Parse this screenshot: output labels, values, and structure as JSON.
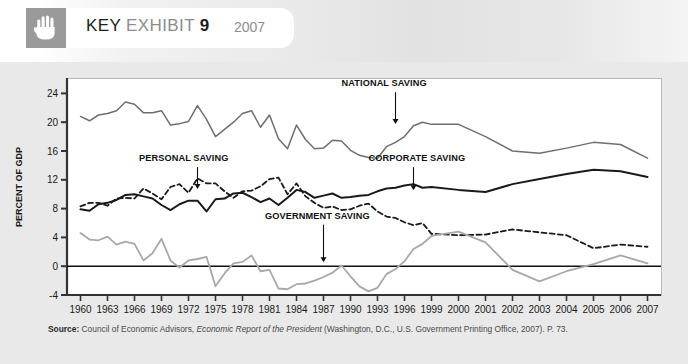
{
  "header": {
    "icon": "hand-icon",
    "title_key": "KEY",
    "title_exhibit": "EXHIBIT",
    "title_number": "9",
    "year": "2007"
  },
  "source": {
    "label": "Source:",
    "text_before_italic": " Council of Economic Advisors, ",
    "italic": "Economic Report of the President",
    "text_after_italic": " (Washington, D.C., U.S. Government Printing Office, 2007). P. 73."
  },
  "colors": {
    "national": "#6e6e6e",
    "personal": "#1a1a1a",
    "corporate": "#1a1a1a",
    "government": "#a8a8a8",
    "axis": "#333333",
    "frame": "#b9b9b9",
    "plot_background": "#ffffff",
    "figure_background": "#e9e9e9",
    "hand_tile": "#9a9a9a"
  },
  "chart_data": {
    "type": "line",
    "title": "KEY EXHIBIT 9",
    "xlabel": "",
    "ylabel": "PERCENT OF GDP",
    "ylim": [
      -4,
      26
    ],
    "yticks": [
      -4,
      0,
      4,
      8,
      12,
      16,
      20,
      24
    ],
    "xlim": [
      1960,
      2007
    ],
    "xtick_labels": [
      "1960",
      "1963",
      "1966",
      "1969",
      "1972",
      "1975",
      "1978",
      "1981",
      "1984",
      "1987",
      "1990",
      "1993",
      "1996",
      "1999",
      "2000",
      "2001",
      "2002",
      "2003",
      "2004",
      "2005",
      "2006",
      "2007"
    ],
    "xtick_values": [
      1960,
      1963,
      1966,
      1969,
      1972,
      1975,
      1978,
      1981,
      1984,
      1987,
      1990,
      1993,
      1996,
      1999,
      2000,
      2001,
      2002,
      2003,
      2004,
      2005,
      2006,
      2007
    ],
    "grid": false,
    "legend_position": "inline-annotations",
    "zero_line": 0,
    "annotations": [
      {
        "label": "NATIONAL SAVING",
        "series": "national",
        "year": 1995,
        "text_x": 1989.0,
        "text_y": 25.0,
        "arrow_to_y": 19.6
      },
      {
        "label": "PERSONAL SAVING",
        "series": "personal",
        "year": 1973,
        "text_x": 1966.5,
        "text_y": 14.6,
        "arrow_to_y": 10.6
      },
      {
        "label": "CORPORATE SAVING",
        "series": "corporate",
        "year": 1997,
        "text_x": 1992.0,
        "text_y": 14.6,
        "arrow_to_y": 10.4
      },
      {
        "label": "GOVERNMENT SAVING",
        "series": "government",
        "year": 1987,
        "text_x": 1980.5,
        "text_y": 6.6,
        "arrow_to_y": 0.4
      }
    ],
    "series": [
      {
        "name": "NATIONAL SAVING",
        "key": "national",
        "color": "#6e6e6e",
        "style": "solid",
        "width": 1.5,
        "x": [
          1960,
          1961,
          1962,
          1963,
          1964,
          1965,
          1966,
          1967,
          1968,
          1969,
          1970,
          1971,
          1972,
          1973,
          1974,
          1975,
          1976,
          1977,
          1978,
          1979,
          1980,
          1981,
          1982,
          1983,
          1984,
          1985,
          1986,
          1987,
          1988,
          1989,
          1990,
          1991,
          1992,
          1993,
          1994,
          1995,
          1996,
          1997,
          1998,
          1999,
          2000,
          2001,
          2002,
          2003,
          2004,
          2005,
          2006,
          2007
        ],
        "values": [
          20.8,
          20.2,
          21.0,
          21.2,
          21.6,
          22.8,
          22.5,
          21.3,
          21.3,
          21.6,
          19.6,
          19.8,
          20.1,
          22.3,
          20.4,
          18.0,
          19.0,
          20.0,
          21.2,
          21.6,
          19.3,
          21.0,
          17.7,
          16.3,
          19.6,
          17.6,
          16.3,
          16.4,
          17.5,
          17.4,
          16.1,
          15.4,
          15.1,
          15.0,
          16.6,
          17.2,
          18.0,
          19.5,
          20.0,
          19.7,
          19.7,
          18.0,
          16.0,
          15.7,
          16.4,
          17.2,
          16.9,
          15.0
        ]
      },
      {
        "name": "PERSONAL SAVING",
        "key": "personal",
        "color": "#1a1a1a",
        "style": "dashed",
        "width": 1.8,
        "x": [
          1960,
          1961,
          1962,
          1963,
          1964,
          1965,
          1966,
          1967,
          1968,
          1969,
          1970,
          1971,
          1972,
          1973,
          1974,
          1975,
          1976,
          1977,
          1978,
          1979,
          1980,
          1981,
          1982,
          1983,
          1984,
          1985,
          1986,
          1987,
          1988,
          1989,
          1990,
          1991,
          1992,
          1993,
          1994,
          1995,
          1996,
          1997,
          1998,
          1999,
          2000,
          2001,
          2002,
          2003,
          2004,
          2005,
          2006,
          2007
        ],
        "values": [
          8.3,
          8.8,
          8.8,
          8.4,
          9.4,
          9.5,
          9.4,
          10.8,
          10.1,
          9.3,
          11.0,
          11.4,
          10.2,
          12.2,
          11.5,
          11.5,
          10.4,
          9.5,
          10.4,
          10.5,
          11.1,
          12.1,
          12.3,
          10.0,
          11.5,
          9.7,
          8.8,
          8.1,
          8.3,
          7.8,
          7.9,
          8.4,
          8.7,
          7.6,
          6.9,
          6.7,
          6.1,
          5.7,
          6.0,
          4.5,
          4.3,
          4.4,
          5.1,
          4.7,
          4.3,
          2.5,
          3.0,
          2.7
        ]
      },
      {
        "name": "CORPORATE SAVING",
        "key": "corporate",
        "color": "#1a1a1a",
        "style": "solid",
        "width": 2.0,
        "x": [
          1960,
          1961,
          1962,
          1963,
          1964,
          1965,
          1966,
          1967,
          1968,
          1969,
          1970,
          1971,
          1972,
          1973,
          1974,
          1975,
          1976,
          1977,
          1978,
          1979,
          1980,
          1981,
          1982,
          1983,
          1984,
          1985,
          1986,
          1987,
          1988,
          1989,
          1990,
          1991,
          1992,
          1993,
          1994,
          1995,
          1996,
          1997,
          1998,
          1999,
          2000,
          2001,
          2002,
          2003,
          2004,
          2005,
          2006,
          2007
        ],
        "values": [
          7.9,
          7.7,
          8.6,
          8.8,
          9.2,
          9.9,
          10.0,
          9.7,
          9.4,
          8.5,
          7.8,
          8.6,
          9.1,
          9.1,
          7.6,
          9.3,
          9.4,
          10.1,
          10.2,
          9.6,
          8.9,
          9.4,
          8.5,
          9.5,
          10.6,
          10.3,
          9.5,
          9.8,
          10.1,
          9.5,
          9.6,
          9.8,
          9.9,
          10.4,
          10.8,
          10.9,
          11.2,
          11.4,
          10.9,
          11.0,
          10.6,
          10.3,
          11.4,
          12.1,
          12.8,
          13.4,
          13.2,
          12.4
        ]
      },
      {
        "name": "GOVERNMENT SAVING",
        "key": "government",
        "color": "#a8a8a8",
        "style": "solid",
        "width": 1.8,
        "x": [
          1960,
          1961,
          1962,
          1963,
          1964,
          1965,
          1966,
          1967,
          1968,
          1969,
          1970,
          1971,
          1972,
          1973,
          1974,
          1975,
          1976,
          1977,
          1978,
          1979,
          1980,
          1981,
          1982,
          1983,
          1984,
          1985,
          1986,
          1987,
          1988,
          1989,
          1990,
          1991,
          1992,
          1993,
          1994,
          1995,
          1996,
          1997,
          1998,
          1999,
          2000,
          2001,
          2002,
          2003,
          2004,
          2005,
          2006,
          2007
        ],
        "values": [
          4.6,
          3.7,
          3.6,
          4.1,
          3.0,
          3.4,
          3.1,
          0.8,
          1.8,
          3.8,
          0.8,
          -0.2,
          0.8,
          1.0,
          1.3,
          -2.8,
          -1.0,
          0.4,
          0.6,
          1.5,
          -0.7,
          -0.5,
          -3.1,
          -3.2,
          -2.5,
          -2.4,
          -2.0,
          -1.5,
          -0.9,
          0.1,
          -1.4,
          -2.8,
          -3.5,
          -3.0,
          -1.1,
          -0.4,
          0.7,
          2.4,
          3.1,
          4.2,
          4.8,
          3.3,
          -0.5,
          -2.1,
          -0.7,
          0.3,
          1.5,
          0.4
        ]
      }
    ]
  }
}
